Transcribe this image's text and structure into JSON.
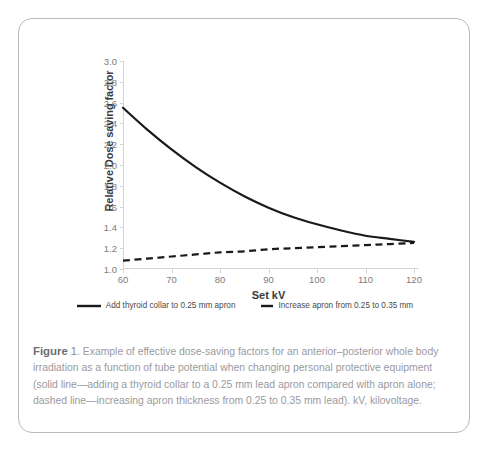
{
  "figure": {
    "label_word": "Figure",
    "number": "1.",
    "caption": "Example of effective dose-saving factors for an anterior–posterior whole body irradiation as a function of tube potential when changing personal protective equipment (solid line—adding a thyroid collar to a 0.25 mm lead apron compared with apron alone; dashed line—increasing apron thickness from 0.25 to 0.35 mm lead). kV, kilovoltage."
  },
  "chart_data": {
    "type": "line",
    "title": "",
    "xlabel": "Set kV",
    "ylabel": "Relative Dose saving factor",
    "xlim": [
      60,
      120
    ],
    "ylim": [
      1.0,
      3.0
    ],
    "xticks": [
      60,
      70,
      80,
      90,
      100,
      110,
      120
    ],
    "yticks": [
      1.0,
      1.2,
      1.4,
      1.6,
      1.8,
      2.0,
      2.2,
      2.4,
      2.6,
      2.8,
      3.0
    ],
    "xtick_labels": [
      "60",
      "70",
      "80",
      "90",
      "100",
      "110",
      "120"
    ],
    "ytick_labels": [
      "1.0",
      "1.2",
      "1.4",
      "1.6",
      "1.8",
      "2.0",
      "2.2",
      "2.4",
      "2.6",
      "2.8",
      "3.0"
    ],
    "grid": false,
    "legend_position": "below",
    "x": [
      60,
      65,
      70,
      75,
      80,
      85,
      90,
      95,
      100,
      105,
      110,
      115,
      120
    ],
    "series": [
      {
        "name": "Add thyroid collar to 0.25 mm apron",
        "style": "solid",
        "color": "#1a1a1a",
        "values": [
          2.55,
          2.34,
          2.15,
          1.98,
          1.83,
          1.7,
          1.59,
          1.5,
          1.43,
          1.37,
          1.32,
          1.29,
          1.26
        ]
      },
      {
        "name": "Increase apron from 0.25 to 0.35 mm",
        "style": "dashed",
        "color": "#1a1a1a",
        "values": [
          1.08,
          1.1,
          1.12,
          1.14,
          1.16,
          1.17,
          1.19,
          1.2,
          1.21,
          1.22,
          1.23,
          1.24,
          1.25
        ]
      }
    ]
  }
}
